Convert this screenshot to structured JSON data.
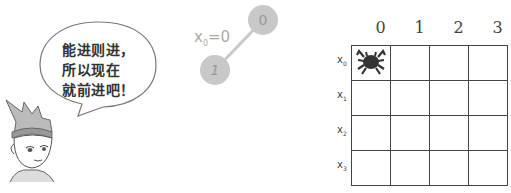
{
  "speech_bubble": {
    "lines": [
      "能进则进，",
      "所以现在",
      "就前进吧！"
    ]
  },
  "character": {
    "description": "cartoon boy with spiky hair and headband"
  },
  "tree": {
    "variable_label": "x",
    "variable_subscript": "0",
    "variable_value": "=0",
    "nodes": [
      {
        "label": "0",
        "cx": 263,
        "cy": 20
      },
      {
        "label": "1",
        "cx": 215,
        "cy": 70
      }
    ],
    "node_color": "#c8c8c8",
    "edge_color": "#c8c8c8"
  },
  "board": {
    "columns": [
      "0",
      "1",
      "2",
      "3"
    ],
    "rows": [
      {
        "label": "x",
        "sub": "0"
      },
      {
        "label": "x",
        "sub": "1"
      },
      {
        "label": "x",
        "sub": "2"
      },
      {
        "label": "x",
        "sub": "3"
      }
    ],
    "piece": {
      "row": 0,
      "col": 0,
      "icon": "crab-icon",
      "color": "#333333"
    }
  }
}
